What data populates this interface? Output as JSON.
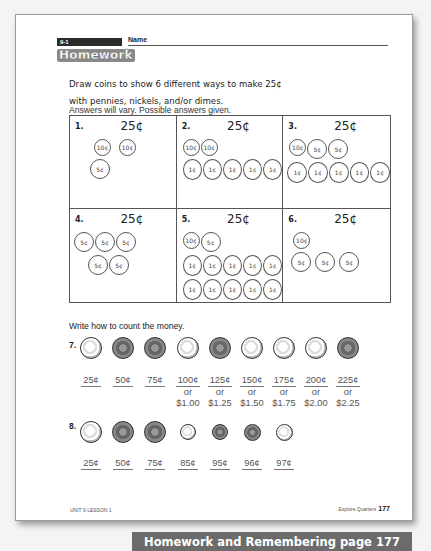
{
  "background_bleed": "Talk Write Think",
  "header": {
    "lesson": "9-1",
    "name_label": "Name",
    "logo": "Homework"
  },
  "instructions": {
    "line1": "Draw coins to show 6 different ways to make 25¢",
    "line2": "with pennies, nickels, and/or dimes.",
    "line3": "Answers will vary. Possible answers given."
  },
  "problems": [
    {
      "num": "1.",
      "amount": "25¢",
      "rows": [
        [
          "10¢",
          "10¢"
        ],
        [
          "5¢"
        ]
      ]
    },
    {
      "num": "2.",
      "amount": "25¢",
      "rows": [
        [
          "10¢",
          "10¢"
        ],
        [
          "1¢",
          "1¢",
          "1¢",
          "1¢",
          "1¢"
        ]
      ]
    },
    {
      "num": "3.",
      "amount": "25¢",
      "rows": [
        [
          "10¢",
          "5¢",
          "5¢"
        ],
        [
          "1¢",
          "1¢",
          "1¢",
          "1¢",
          "1¢"
        ]
      ]
    },
    {
      "num": "4.",
      "amount": "25¢",
      "rows": [
        [
          "5¢",
          "5¢",
          "5¢"
        ],
        [
          "5¢",
          "5¢"
        ]
      ]
    },
    {
      "num": "5.",
      "amount": "25¢",
      "rows": [
        [
          "10¢",
          "5¢"
        ],
        [
          "1¢",
          "1¢",
          "1¢",
          "1¢",
          "1¢"
        ],
        [
          "1¢",
          "1¢",
          "1¢",
          "1¢",
          "1¢"
        ]
      ]
    },
    {
      "num": "6.",
      "amount": "25¢",
      "rows": [
        [
          "10¢"
        ],
        [
          "5¢",
          "5¢",
          "5¢"
        ]
      ]
    }
  ],
  "count_section": {
    "label": "Write how to count the money.",
    "p7": {
      "num": "7.",
      "coins": [
        "quarter",
        "quarter",
        "quarter",
        "quarter",
        "quarter",
        "quarter",
        "quarter",
        "quarter",
        "quarter"
      ],
      "answers": [
        {
          "top": "25¢"
        },
        {
          "top": "50¢"
        },
        {
          "top": "75¢"
        },
        {
          "top": "100¢",
          "or": "or",
          "dollar": "$1.00"
        },
        {
          "top": "125¢",
          "or": "or",
          "dollar": "$1.25"
        },
        {
          "top": "150¢",
          "or": "or",
          "dollar": "$1.50"
        },
        {
          "top": "175¢",
          "or": "or",
          "dollar": "$1.75"
        },
        {
          "top": "200¢",
          "or": "or",
          "dollar": "$2.00"
        },
        {
          "top": "225¢",
          "or": "or",
          "dollar": "$2.25"
        }
      ]
    },
    "p8": {
      "num": "8.",
      "coins": [
        "quarter",
        "quarter",
        "quarter",
        "dime",
        "dime",
        "penny",
        "penny"
      ],
      "answers": [
        {
          "top": "25¢"
        },
        {
          "top": "50¢"
        },
        {
          "top": "75¢"
        },
        {
          "top": "85¢"
        },
        {
          "top": "95¢"
        },
        {
          "top": "96¢"
        },
        {
          "top": "97¢"
        }
      ]
    }
  },
  "footer": {
    "left": "UNIT 9 LESSON 1",
    "right_label": "Explore Quarters",
    "page_number": "177"
  },
  "banner": "Homework and Remembering page 177"
}
